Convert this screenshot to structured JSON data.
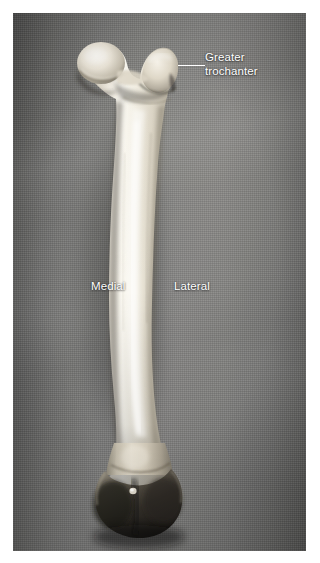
{
  "figure": {
    "caption_visible": false,
    "background_color": "#7a7a78",
    "plate_bounds": {
      "x": 13,
      "y": 13,
      "width": 293,
      "height": 538
    }
  },
  "annotations": [
    {
      "id": "greater-trochanter",
      "label": "Greater\ntrochanter",
      "color": "#ffffff",
      "has_leader_line": true
    },
    {
      "id": "medial",
      "label": "Medial",
      "color": "#ffffff",
      "has_leader_line": false
    },
    {
      "id": "lateral",
      "label": "Lateral",
      "color": "#ffffff",
      "has_leader_line": false
    }
  ],
  "specimen": {
    "bone_color_light": "#f3efe6",
    "bone_color_mid": "#cfc8b8",
    "bone_color_shadow": "#2d2a26",
    "parts": [
      "head-of-femur",
      "greater-trochanter",
      "neck",
      "shaft",
      "distal-condyles"
    ]
  }
}
